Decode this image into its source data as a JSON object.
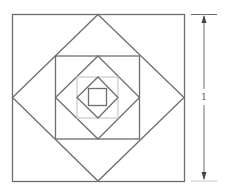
{
  "figure": {
    "dimension_label": "1",
    "colors": {
      "stroke": "#6e6e6e",
      "light_stroke": "#c8c8c8",
      "background": "#ffffff"
    },
    "shapes": [
      {
        "type": "square",
        "level": 0,
        "style": "dark"
      },
      {
        "type": "diamond",
        "level": 1,
        "style": "dark"
      },
      {
        "type": "square",
        "level": 2,
        "style": "dark"
      },
      {
        "type": "diamond",
        "level": 3,
        "style": "dark"
      },
      {
        "type": "square",
        "level": 4,
        "style": "light"
      },
      {
        "type": "diamond",
        "level": 5,
        "style": "dark"
      },
      {
        "type": "square",
        "level": 6,
        "style": "dark"
      }
    ]
  }
}
